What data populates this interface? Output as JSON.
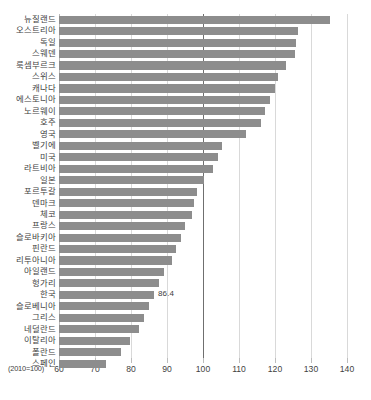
{
  "chart": {
    "title": "",
    "unit_note": "(2010=100)"
  },
  "chart_data": {
    "type": "bar",
    "orientation": "horizontal",
    "title": "",
    "xlabel": "(2010=100)",
    "ylabel": "",
    "xlim": [
      60,
      140
    ],
    "xticks": [
      60,
      70,
      80,
      90,
      100,
      110,
      120,
      130,
      140
    ],
    "grid": true,
    "reference_line": 100,
    "legend": null,
    "bar_color": "#8d8d8d",
    "categories": [
      "뉴질랜드",
      "오스트리아",
      "독일",
      "스웨덴",
      "룩셈부르크",
      "스위스",
      "캐나다",
      "에스토니아",
      "노르웨이",
      "호주",
      "영국",
      "벨기에",
      "미국",
      "라트비아",
      "일본",
      "포르투갈",
      "덴마크",
      "체코",
      "프랑스",
      "슬로바키아",
      "핀란드",
      "리투아니아",
      "아일랜드",
      "헝가리",
      "한국",
      "슬로베니아",
      "그리스",
      "네덜란드",
      "이탈리아",
      "폴란드",
      "스페인"
    ],
    "values": [
      135.2,
      126.3,
      125.9,
      125.5,
      123.1,
      120.8,
      119.9,
      118.6,
      117.3,
      116.2,
      112.0,
      105.4,
      104.1,
      102.8,
      100.2,
      98.3,
      97.6,
      96.9,
      95.1,
      93.8,
      92.6,
      91.4,
      89.2,
      87.8,
      86.4,
      85.0,
      83.6,
      82.1,
      79.8,
      77.2,
      73.1
    ],
    "data_labels": {
      "한국": "86.4"
    }
  }
}
